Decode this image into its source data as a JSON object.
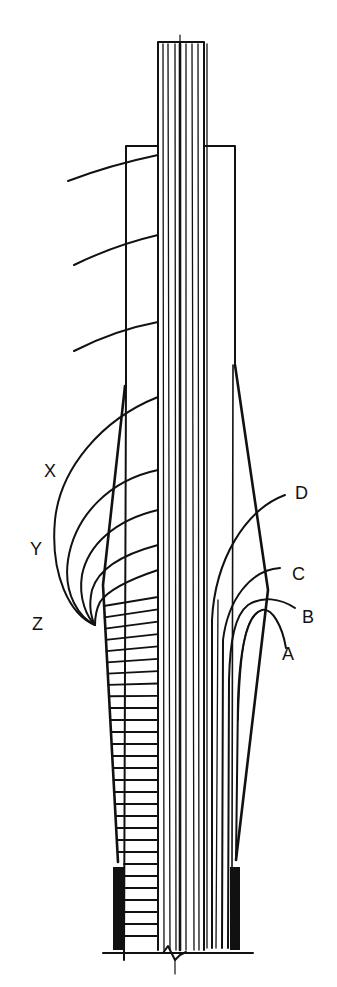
{
  "figure": {
    "type": "technical line drawing",
    "colors": {
      "ink": "#111111",
      "paper": "#ffffff"
    }
  },
  "labels": {
    "left": [
      {
        "id": "X",
        "text": "X"
      },
      {
        "id": "Y",
        "text": "Y"
      },
      {
        "id": "Z",
        "text": "Z"
      }
    ],
    "right": [
      {
        "id": "D",
        "text": "D"
      },
      {
        "id": "C",
        "text": "C"
      },
      {
        "id": "B",
        "text": "B"
      },
      {
        "id": "A",
        "text": "A"
      }
    ]
  }
}
